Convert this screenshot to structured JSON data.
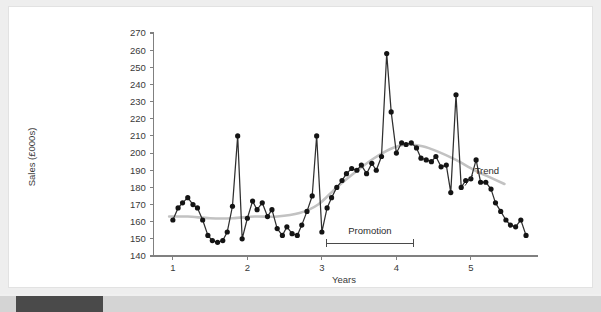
{
  "chart_data": {
    "type": "line",
    "title": "",
    "xlabel": "Years",
    "ylabel": "Sales (£000s)",
    "xlim": [
      0.72,
      5.82
    ],
    "ylim": [
      140,
      270
    ],
    "yticks": [
      140,
      150,
      160,
      170,
      180,
      190,
      200,
      210,
      220,
      230,
      240,
      250,
      260,
      270
    ],
    "xticks": [
      1,
      2,
      3,
      4,
      5
    ],
    "grid": false,
    "legend": "none",
    "marker": "filled-circle",
    "series": [
      {
        "name": "Sales",
        "color": "#2f2f2f",
        "x": [
          1.0,
          1.07,
          1.13,
          1.2,
          1.27,
          1.33,
          1.4,
          1.47,
          1.53,
          1.6,
          1.67,
          1.73,
          1.8,
          1.87,
          1.93,
          2.0,
          2.07,
          2.13,
          2.2,
          2.27,
          2.33,
          2.4,
          2.47,
          2.53,
          2.6,
          2.67,
          2.73,
          2.8,
          2.87,
          2.93,
          3.0,
          3.07,
          3.13,
          3.2,
          3.27,
          3.33,
          3.4,
          3.47,
          3.53,
          3.6,
          3.67,
          3.73,
          3.8,
          3.87,
          3.93,
          4.0,
          4.07,
          4.13,
          4.2,
          4.27,
          4.33,
          4.4,
          4.47,
          4.53,
          4.6,
          4.67,
          4.73,
          4.8,
          4.87,
          4.93,
          5.0,
          5.07,
          5.13,
          5.2,
          5.27,
          5.33,
          5.4,
          5.47,
          5.53,
          5.6,
          5.67
        ],
        "values": [
          161,
          168,
          171,
          174,
          170,
          168,
          161,
          152,
          149,
          148,
          149,
          154,
          169,
          210,
          150,
          162,
          172,
          167,
          171,
          163,
          167,
          156,
          152,
          157,
          153,
          152,
          158,
          166,
          175,
          210,
          154,
          168,
          174,
          180,
          184,
          188,
          191,
          190,
          193,
          188,
          194,
          190,
          198,
          258,
          224,
          200,
          206,
          205,
          206,
          203,
          197,
          196,
          195,
          198,
          192,
          193,
          177,
          234,
          180,
          184,
          185,
          196,
          183,
          183,
          179,
          171,
          166,
          161,
          158,
          157,
          161
        ]
      }
    ],
    "trend": {
      "name": "Trend",
      "color": "#c2c2c2",
      "x": [
        0.95,
        1.2,
        1.5,
        1.8,
        2.1,
        2.4,
        2.7,
        2.95,
        3.2,
        3.45,
        3.7,
        3.95,
        4.15,
        4.35,
        4.55,
        4.8,
        5.05,
        5.3,
        5.45
      ],
      "values": [
        163,
        163,
        162,
        162,
        163,
        163,
        165,
        170,
        180,
        189,
        197,
        203,
        205,
        204,
        201,
        196,
        190,
        185,
        182
      ]
    },
    "annotations": [
      {
        "name": "promotion-bracket",
        "label": "Promotion",
        "x_start": 3.06,
        "x_end": 4.23,
        "y": 147.5,
        "label_y": 153
      },
      {
        "name": "trend-callout",
        "label": "Trend",
        "label_x": 5.05,
        "label_y": 190,
        "point_x": 4.92,
        "point_y": 181
      }
    ],
    "end_point_last": 152
  },
  "scrollbar": {
    "name": "horizontal-scrollbar",
    "thumb_left_px": 16,
    "thumb_width_px": 87
  }
}
